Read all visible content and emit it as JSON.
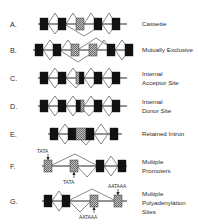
{
  "figure": {
    "colors": {
      "exon_constitutive": "#121212",
      "exon_alternative": "#9a9a9a",
      "line": "#2b2b2b",
      "arc": "#555555",
      "background": "#ffffff"
    },
    "rows": [
      {
        "letter": "A.",
        "label_lines": [
          "Cassette"
        ],
        "label": "Cassette",
        "exons": [
          {
            "type": "constitutive",
            "shade": "black"
          },
          {
            "type": "constitutive",
            "shade": "black"
          },
          {
            "type": "alternative",
            "shade": "gray"
          },
          {
            "type": "constitutive",
            "shade": "black"
          },
          {
            "type": "constitutive",
            "shade": "black"
          }
        ],
        "motifs": []
      },
      {
        "letter": "B.",
        "label_lines": [
          "Mutually Exclusive"
        ],
        "label": "Mutually Exclusive",
        "exons": [
          {
            "type": "constitutive",
            "shade": "black"
          },
          {
            "type": "constitutive",
            "shade": "black"
          },
          {
            "type": "alternative",
            "shade": "gray"
          },
          {
            "type": "alternative",
            "shade": "gray"
          },
          {
            "type": "constitutive",
            "shade": "black"
          },
          {
            "type": "constitutive",
            "shade": "black"
          }
        ],
        "motifs": []
      },
      {
        "letter": "C.",
        "label_lines": [
          "Internal",
          "Acceptor Site"
        ],
        "label": "Internal Acceptor Site",
        "exons": [
          {
            "type": "constitutive",
            "shade": "black"
          },
          {
            "type": "constitutive",
            "shade": "black"
          },
          {
            "type": "split",
            "shade": "gray-left-black-right"
          },
          {
            "type": "constitutive",
            "shade": "black"
          },
          {
            "type": "constitutive",
            "shade": "black"
          }
        ],
        "motifs": []
      },
      {
        "letter": "D.",
        "label_lines": [
          "Internal",
          "Donor Site"
        ],
        "label": "Internal Donor Site",
        "exons": [
          {
            "type": "constitutive",
            "shade": "black"
          },
          {
            "type": "constitutive",
            "shade": "black"
          },
          {
            "type": "split",
            "shade": "black-left-gray-right"
          },
          {
            "type": "constitutive",
            "shade": "black"
          },
          {
            "type": "constitutive",
            "shade": "black"
          }
        ],
        "motifs": []
      },
      {
        "letter": "E.",
        "label_lines": [
          "Retained Intron"
        ],
        "label": "Retained Intron",
        "exons": [
          {
            "type": "constitutive",
            "shade": "black"
          },
          {
            "type": "constitutive",
            "shade": "black"
          },
          {
            "type": "alternative",
            "shade": "gray"
          },
          {
            "type": "constitutive",
            "shade": "black"
          },
          {
            "type": "constitutive",
            "shade": "black"
          }
        ],
        "motifs": []
      },
      {
        "letter": "F.",
        "label_lines": [
          "Multiple",
          "Promoters"
        ],
        "label": "Multiple Promoters",
        "exons": [
          {
            "type": "alternative",
            "shade": "gray"
          },
          {
            "type": "alternative",
            "shade": "gray"
          },
          {
            "type": "constitutive",
            "shade": "black"
          },
          {
            "type": "constitutive",
            "shade": "black"
          }
        ],
        "motifs": [
          {
            "text": "TATA",
            "position": "above",
            "target_exon": 0
          },
          {
            "text": "TATA",
            "position": "below",
            "target_exon": 1
          }
        ]
      },
      {
        "letter": "G.",
        "label_lines": [
          "Multiple",
          "Polyadenylation",
          "Sites"
        ],
        "label": "Multiple Polyadenylation Sites",
        "exons": [
          {
            "type": "constitutive",
            "shade": "black"
          },
          {
            "type": "constitutive",
            "shade": "black"
          },
          {
            "type": "alternative",
            "shade": "gray"
          },
          {
            "type": "alternative",
            "shade": "gray"
          }
        ],
        "motifs": [
          {
            "text": "AATAAA",
            "position": "below",
            "target_exon": 2
          },
          {
            "text": "AATAAA",
            "position": "above",
            "target_exon": 3
          }
        ]
      }
    ]
  }
}
